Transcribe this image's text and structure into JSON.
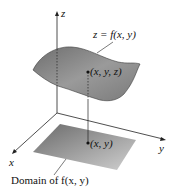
{
  "diagram": {
    "axes": {
      "z_label": "z",
      "x_label": "x",
      "y_label": "y"
    },
    "surface_label": "z = f(x, y)",
    "point_label": "(x, y, z)",
    "domain_point_label": "(x, y)",
    "domain_caption": "Domain of f(x, y)",
    "colors": {
      "surface_fill": "#8a8a8a",
      "surface_edge": "#3a3a3a",
      "domain_fill": "#9a9a9a",
      "axis": "#222222",
      "background": "#ffffff"
    }
  }
}
